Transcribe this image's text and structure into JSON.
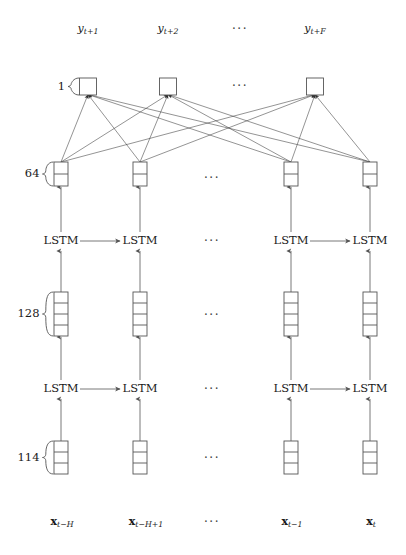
{
  "figure": {
    "background_color": "#ffffff",
    "stroke_color": "#555555",
    "link_color": "#3a3a3a",
    "text_color": "#1a1a1a",
    "width": 406,
    "height": 555
  },
  "outputs": {
    "row_label": "outputs",
    "items": [
      {
        "base": "y",
        "sub": "t+1",
        "x": 88
      },
      {
        "base": "y",
        "sub": "t+2",
        "x": 168
      },
      {
        "base": "y",
        "sub": "t+F",
        "x": 315
      }
    ],
    "ellipsis": "···",
    "ellipsis_x": 240,
    "y": 29
  },
  "inputs": {
    "row_label": "inputs",
    "items": [
      {
        "base": "x",
        "sub": "t−H",
        "x": 62
      },
      {
        "base": "x",
        "sub": "t−H+1",
        "x": 146
      },
      {
        "base": "x",
        "sub": "t−1",
        "x": 292
      },
      {
        "base": "x",
        "sub": "t",
        "x": 371
      }
    ],
    "ellipsis": "···",
    "ellipsis_x": 212,
    "y": 522
  },
  "layers": [
    {
      "id": "output-dense",
      "size_label": "1",
      "cells": 1,
      "brace": true,
      "y_top": 78,
      "box_w": 17,
      "cell_h": 17,
      "columns": [
        88,
        168,
        315
      ]
    },
    {
      "id": "dense-64",
      "size_label": "64",
      "cells": 2,
      "brace": true,
      "y_top": 162,
      "box_w": 14,
      "cell_h": 12,
      "columns": [
        61,
        140,
        291,
        370
      ]
    },
    {
      "id": "lstm-layer-2",
      "size_label": "",
      "cells": 0,
      "brace": false,
      "y_top": 241,
      "box_w": 0,
      "cell_h": 0,
      "columns": [
        61,
        140,
        291,
        370
      ]
    },
    {
      "id": "hidden-128",
      "size_label": "128",
      "cells": 4,
      "brace": true,
      "y_top": 292,
      "box_w": 14,
      "cell_h": 11,
      "columns": [
        61,
        140,
        291,
        370
      ]
    },
    {
      "id": "lstm-layer-1",
      "size_label": "",
      "cells": 0,
      "brace": false,
      "y_top": 389,
      "box_w": 0,
      "cell_h": 0,
      "columns": [
        61,
        140,
        291,
        370
      ]
    },
    {
      "id": "input-114",
      "size_label": "114",
      "cells": 3,
      "brace": true,
      "y_top": 441,
      "box_w": 14,
      "cell_h": 11,
      "columns": [
        61,
        140,
        291,
        370
      ]
    }
  ],
  "lstm_rows": [
    {
      "id": "lstm-row-upper",
      "y": 241,
      "label": "LSTM",
      "columns": [
        61,
        140,
        291,
        370
      ],
      "recurrent_arrows": [
        [
          61,
          140
        ],
        [
          291,
          370
        ]
      ],
      "ellipsis": "···",
      "ellipsis_x": 212
    },
    {
      "id": "lstm-row-lower",
      "y": 389,
      "label": "LSTM",
      "columns": [
        61,
        140,
        291,
        370
      ],
      "recurrent_arrows": [
        [
          61,
          140
        ],
        [
          291,
          370
        ]
      ],
      "ellipsis": "···",
      "ellipsis_x": 212
    }
  ],
  "ellipses": [
    {
      "id": "ellipsis-dense64",
      "x": 212,
      "y": 178,
      "text": "···"
    },
    {
      "id": "ellipsis-hidden128",
      "x": 212,
      "y": 315,
      "text": "···"
    },
    {
      "id": "ellipsis-input114",
      "x": 212,
      "y": 458,
      "text": "···"
    },
    {
      "id": "ellipsis-output",
      "x": 240,
      "y": 86,
      "text": "···"
    }
  ],
  "dense_connections": {
    "id": "fully-connected-edges",
    "description": "every 64-unit column connects to every output unit",
    "from_columns": [
      61,
      140,
      291,
      370
    ],
    "to_columns": [
      88,
      168,
      315
    ]
  }
}
